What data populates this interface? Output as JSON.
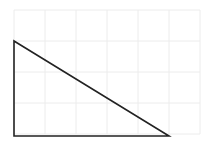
{
  "diagram": {
    "type": "right-triangle-on-grid",
    "grid": {
      "x0": 14,
      "y0": 10,
      "cell": 31,
      "cols": 6,
      "rows": 4,
      "line_color": "#ececec",
      "line_width": 1
    },
    "triangle": {
      "vertices": [
        [
          14,
          41
        ],
        [
          14,
          136
        ],
        [
          169,
          136
        ]
      ],
      "stroke": "#222222",
      "stroke_width": 1.6,
      "fill": "none"
    }
  }
}
